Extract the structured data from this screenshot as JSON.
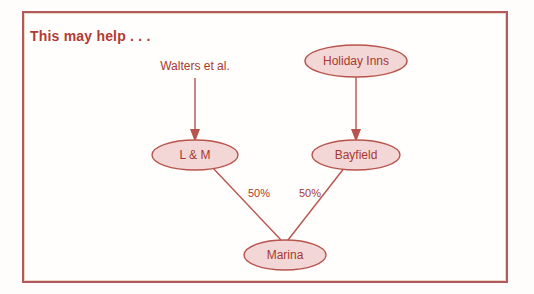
{
  "slide": {
    "title": "This may help . . .",
    "background_color": "#fffefd",
    "frame_color": "#b4585e",
    "accent_color": "#a8372f",
    "node_fill_color": "#f3d7d6",
    "node_stroke_color": "#b8544d"
  },
  "diagram": {
    "type": "ownership-structure",
    "free_labels": [
      {
        "id": "walters",
        "text": "Walters et al."
      }
    ],
    "nodes": [
      {
        "id": "holiday_inns",
        "label": "Holiday Inns"
      },
      {
        "id": "bayfield",
        "label": "Bayfield"
      },
      {
        "id": "lm",
        "label": "L & M"
      },
      {
        "id": "marina",
        "label": "Marina"
      }
    ],
    "edges": [
      {
        "id": "walters-to-lm",
        "from": "Walters et al.",
        "to": "L & M",
        "label": "",
        "arrow": true
      },
      {
        "id": "holiday-to-bayfield",
        "from": "Holiday Inns",
        "to": "Bayfield",
        "label": "",
        "arrow": true
      },
      {
        "id": "lm-to-marina",
        "from": "L & M",
        "to": "Marina",
        "label": "50%",
        "arrow": false
      },
      {
        "id": "bayfield-to-marina",
        "from": "Bayfield",
        "to": "Marina",
        "label": "50%",
        "arrow": false
      }
    ]
  }
}
